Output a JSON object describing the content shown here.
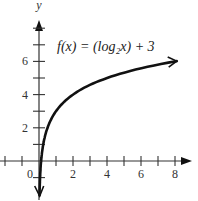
{
  "chart_data": {
    "type": "line",
    "title": "",
    "function_label": "f(x) = (log₂x) + 3",
    "xlabel": "",
    "ylabel": "y",
    "xlim": [
      -2,
      9
    ],
    "ylim": [
      -2,
      8
    ],
    "x_ticks": [
      -2,
      -1,
      1,
      2,
      3,
      4,
      5,
      6,
      7,
      8
    ],
    "x_tick_labels": {
      "0": "0",
      "2": "2",
      "4": "4",
      "6": "6",
      "8": "8"
    },
    "y_ticks": [
      -1,
      1,
      2,
      3,
      4,
      5,
      6,
      7,
      8
    ],
    "y_tick_labels": {
      "2": "2",
      "4": "4",
      "6": "6"
    },
    "grid": false,
    "series": [
      {
        "name": "f(x) = (log2 x) + 3",
        "x": [
          0.04,
          0.0625,
          0.125,
          0.25,
          0.5,
          1,
          2,
          4,
          8
        ],
        "values": [
          -1.64,
          -1,
          0,
          1,
          2,
          3,
          4,
          5,
          6
        ]
      }
    ],
    "line_color": "#111111",
    "axis_color": "#333333"
  }
}
